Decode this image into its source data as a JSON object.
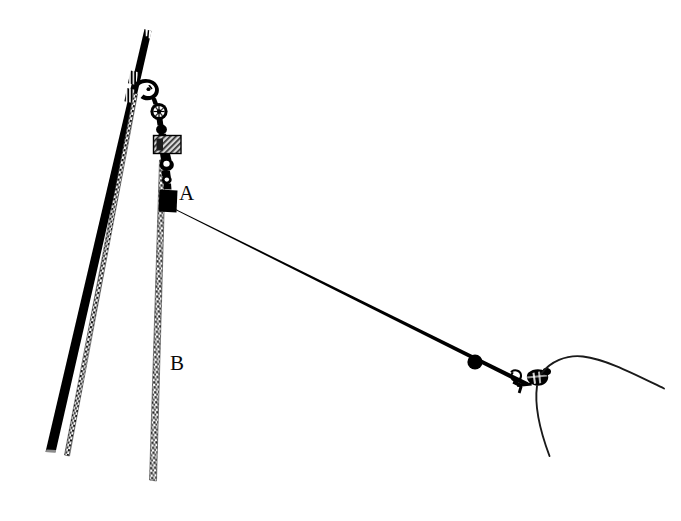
{
  "figure": {
    "background_color": "#ffffff",
    "ink_color": "#000000",
    "width": 681,
    "height": 521
  },
  "labels": [
    {
      "id": "A",
      "text": "A",
      "x": 179,
      "y": 183,
      "refers_to": "upper attachment block on lower shackle"
    },
    {
      "id": "B",
      "text": "B",
      "x": 170,
      "y": 353,
      "refers_to": "braided rope descending from assembly"
    }
  ],
  "parts": {
    "mast": {
      "name": "mast-pole",
      "color": "#000000",
      "top": [
        144,
        29
      ],
      "bottom": [
        46,
        452
      ]
    },
    "stay_rope": {
      "name": "stay-rope",
      "color": "#1a1a1a",
      "top": [
        134,
        94
      ],
      "bottom": [
        66,
        455
      ]
    },
    "rope_b": {
      "name": "rope-b",
      "color": "#1a1a1a",
      "top": [
        161,
        162
      ],
      "bottom": [
        152,
        481
      ]
    },
    "guy_line": {
      "name": "guy-line",
      "color": "#000000",
      "start": [
        170,
        211
      ],
      "end": [
        527,
        380
      ]
    },
    "bead": {
      "name": "line-bead",
      "color": "#000000",
      "center": [
        475,
        362
      ],
      "radius": 7
    },
    "hook": {
      "name": "hook-clip",
      "color": "#000000",
      "center": [
        519,
        380
      ]
    },
    "knot": {
      "name": "knot-cluster",
      "color": "#000000",
      "center": [
        538,
        378
      ]
    },
    "tail_line": {
      "name": "knot-tail",
      "color": "#1a1a1a",
      "start": [
        537,
        385
      ],
      "end": [
        549,
        456
      ]
    },
    "curve_line": {
      "name": "slack-curve",
      "color": "#1a1a1a",
      "start": [
        540,
        374
      ],
      "peak": [
        582,
        356
      ],
      "end": [
        664,
        388
      ]
    },
    "shackle_upper": {
      "name": "upper-shackle",
      "color": "#000000"
    },
    "ring": {
      "name": "ring-thimble",
      "color": "#000000"
    },
    "plate": {
      "name": "hatched-plate",
      "color": "#555555"
    },
    "block_a": {
      "name": "block-a",
      "color": "#000000"
    },
    "lashings": {
      "name": "mast-lashings",
      "count": 2,
      "color": "#ffffff"
    }
  }
}
